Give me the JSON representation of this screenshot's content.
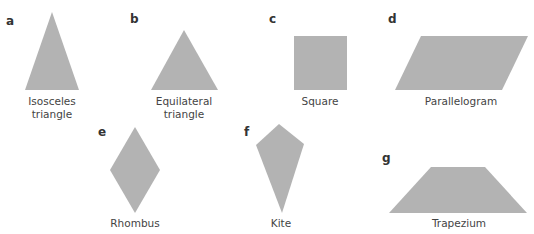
{
  "figure": {
    "fill_color": "#b3b3b3",
    "shapes": [
      {
        "id": "a",
        "letter": "a",
        "name_line1": "Isosceles",
        "name_line2": "triangle",
        "type": "isosceles-triangle",
        "points": "52,12 79,90 25,90",
        "letter_pos": [
          6,
          15
        ],
        "label_pos": [
          52,
          95
        ]
      },
      {
        "id": "b",
        "letter": "b",
        "name_line1": "Equilateral",
        "name_line2": "triangle",
        "type": "equilateral-triangle",
        "points": "184,30 218,90 151,90",
        "letter_pos": [
          130,
          13
        ],
        "label_pos": [
          184,
          95
        ]
      },
      {
        "id": "c",
        "letter": "c",
        "name_line1": "Square",
        "name_line2": "",
        "type": "square",
        "points": "294,36 347,36 347,90 294,90",
        "letter_pos": [
          269,
          13
        ],
        "label_pos": [
          320,
          95
        ]
      },
      {
        "id": "d",
        "letter": "d",
        "name_line1": "Parallelogram",
        "name_line2": "",
        "type": "parallelogram",
        "points": "421,36 528,36 502,90 395,90",
        "letter_pos": [
          388,
          13
        ],
        "label_pos": [
          461,
          95
        ]
      },
      {
        "id": "e",
        "letter": "e",
        "name_line1": "Rhombus",
        "name_line2": "",
        "type": "rhombus",
        "points": "135,127 160,170 135,213 110,170",
        "letter_pos": [
          98,
          126
        ],
        "label_pos": [
          135,
          217
        ]
      },
      {
        "id": "f",
        "letter": "f",
        "name_line1": "Kite",
        "name_line2": "",
        "type": "kite",
        "points": "279,124 304,144 282,213 256,145",
        "letter_pos": [
          244,
          126
        ],
        "label_pos": [
          281,
          217
        ]
      },
      {
        "id": "g",
        "letter": "g",
        "name_line1": "Trapezium",
        "name_line2": "",
        "type": "trapezium",
        "points": "431,167 485,167 527,213 389,213",
        "letter_pos": [
          382,
          152
        ],
        "label_pos": [
          459,
          217
        ]
      }
    ]
  }
}
